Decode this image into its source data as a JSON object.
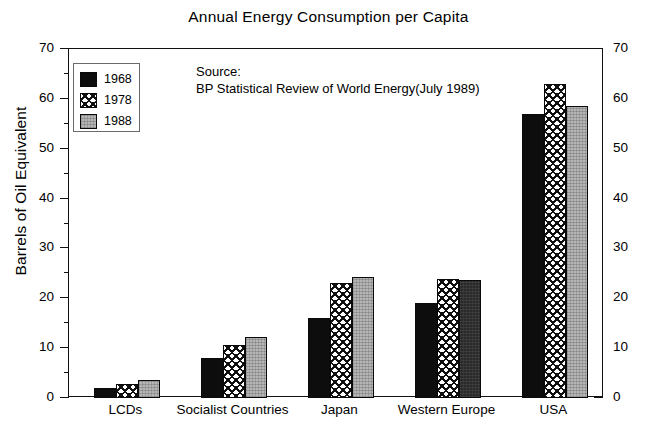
{
  "chart_data": {
    "type": "bar",
    "title": "Annual Energy Consumption per Capita",
    "xlabel": "",
    "ylabel": "Barrels of Oil Equivalent",
    "ylim": [
      0,
      70
    ],
    "ytick_step": 10,
    "yminor_step": 5,
    "grid": false,
    "legend_position": "upper-left-inside",
    "dual_y_axis": true,
    "categories": [
      "LCDs",
      "Socialist Countries",
      "Japan",
      "Western Europe",
      "USA"
    ],
    "yticks": [
      "0",
      "10",
      "20",
      "30",
      "40",
      "50",
      "60",
      "70"
    ],
    "series": [
      {
        "name": "1968",
        "fill": "solid-black",
        "color": "#0d0d0d",
        "values": [
          2.0,
          8.0,
          16.0,
          19.0,
          57.0
        ]
      },
      {
        "name": "1978",
        "fill": "crosshatch",
        "color": "#ffffff",
        "values": [
          2.8,
          10.6,
          23.0,
          23.8,
          63.0
        ]
      },
      {
        "name": "1988",
        "fill": "gray-stipple",
        "color": "#b5b5b5",
        "values": [
          3.6,
          12.3,
          24.2,
          23.6,
          58.5
        ]
      }
    ],
    "annotations": [
      {
        "name": "source-note",
        "line1": "Source:",
        "line2": "BP Statistical Review of World Energy(July 1989)"
      }
    ]
  },
  "source": {
    "line1": "Source:",
    "line2": "BP Statistical Review of World Energy(July 1989)"
  }
}
